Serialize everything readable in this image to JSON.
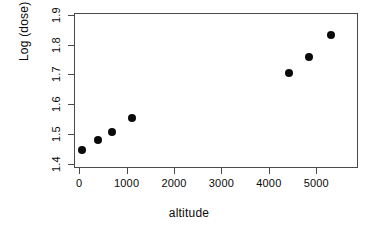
{
  "chart_data": {
    "type": "scatter",
    "title": "",
    "xlabel": "altitude",
    "ylabel": "Log (dose)",
    "xlim": [
      -110,
      5880
    ],
    "ylim": [
      1.385,
      1.907
    ],
    "grid": false,
    "legend": null,
    "xticks": [
      0,
      1000,
      2000,
      3000,
      4000,
      5000
    ],
    "xticklabels": [
      "0",
      "1000",
      "2000",
      "3000",
      "4000",
      "5000"
    ],
    "yticks": [
      1.4,
      1.5,
      1.6,
      1.7,
      1.8,
      1.9
    ],
    "yticklabels": [
      "1.4",
      "1.5",
      "1.6",
      "1.7",
      "1.8",
      "1.9"
    ],
    "marker": "filled-circle",
    "marker_color": "#0a0a0a",
    "points": [
      {
        "x": 60,
        "y": 1.445
      },
      {
        "x": 400,
        "y": 1.478
      },
      {
        "x": 700,
        "y": 1.505
      },
      {
        "x": 1120,
        "y": 1.553
      },
      {
        "x": 4430,
        "y": 1.705
      },
      {
        "x": 4840,
        "y": 1.76
      },
      {
        "x": 5300,
        "y": 1.832
      }
    ],
    "series": [
      {
        "name": "altitude vs Log (dose)",
        "x": [
          60,
          400,
          700,
          1120,
          4430,
          4840,
          5300
        ],
        "values": [
          1.445,
          1.478,
          1.505,
          1.553,
          1.705,
          1.76,
          1.832
        ]
      }
    ]
  },
  "figure": {
    "background": "#ffffff",
    "axis_color": "#4a4a4a",
    "text_color": "#0a0a0a"
  }
}
